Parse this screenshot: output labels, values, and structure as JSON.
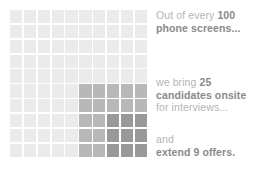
{
  "chart_data": {
    "type": "waffle",
    "title": "",
    "total_cells": 100,
    "grid": {
      "columns": 10,
      "rows": 10
    },
    "categories": [
      "phone screens",
      "candidates onsite",
      "offers extended"
    ],
    "values": [
      100,
      25,
      9
    ],
    "series": [
      {
        "name": "phone screens",
        "value": 100,
        "color": "#ebebeb",
        "block": {
          "cols": 10,
          "rows": 10
        }
      },
      {
        "name": "candidates onsite",
        "value": 25,
        "color": "#b8b8b8",
        "block": {
          "cols": 5,
          "rows": 5
        }
      },
      {
        "name": "offers extended",
        "value": 9,
        "color": "#999999",
        "block": {
          "cols": 3,
          "rows": 3
        }
      }
    ],
    "legend_position": "right",
    "grid_visible": true,
    "xlabel": "",
    "ylabel": ""
  },
  "colors": {
    "background": "#ffffff",
    "tier_light": "#ebebeb",
    "tier_medium": "#b8b8b8",
    "tier_dark": "#999999",
    "text_regular": "#b5b5b5",
    "text_bold": "#8a8a8a"
  },
  "legend": {
    "screens": {
      "line1_prefix": "Out of every ",
      "line1_number": "100",
      "line2": "phone screens..."
    },
    "onsite": {
      "line1_prefix": "we bring ",
      "line1_number": "25",
      "line2": "candidates onsite",
      "line3": "for interviews..."
    },
    "offers": {
      "line1": "and",
      "line2": "extend 9 offers."
    }
  }
}
